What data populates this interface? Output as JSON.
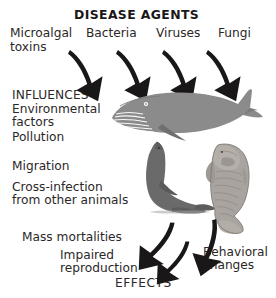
{
  "figure": {
    "title": "DISEASE AGENTS",
    "footer": "EFFECTS",
    "influences_heading": "INFLUENCES"
  },
  "agents": [
    {
      "label": "Microalgal",
      "label2": "toxins"
    },
    {
      "label": "Bacteria"
    },
    {
      "label": "Viruses"
    },
    {
      "label": "Fungi"
    }
  ],
  "influences": [
    {
      "line1": "Environmental",
      "line2": "factors"
    },
    {
      "line1": "Pollution"
    },
    {
      "line1": "Migration"
    },
    {
      "line1": "Cross-infection",
      "line2": "from other animals"
    }
  ],
  "effects": [
    {
      "line1": "Mass mortalities"
    },
    {
      "line1": "Impaired",
      "line2": "reproduction"
    },
    {
      "line1": "Behavioral",
      "line2": "changes"
    }
  ],
  "animals": [
    {
      "name": "baleen-whale"
    },
    {
      "name": "sea-lion"
    },
    {
      "name": "manatee"
    }
  ],
  "arrows": {
    "top_count": 4,
    "bottom_count": 3
  },
  "colors": {
    "text": "#2b2728",
    "arrow": "#1a1718",
    "whale": "#8b8b8b",
    "sealion": "#6f6f6f",
    "manatee": "#a9a49f",
    "background": "#ffffff"
  }
}
